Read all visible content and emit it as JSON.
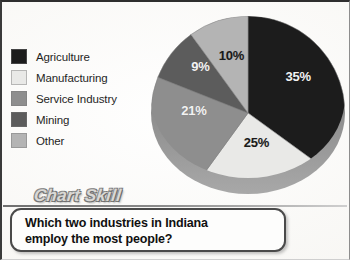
{
  "page": {
    "background_color": "#faf9f7"
  },
  "legend": {
    "name": "pie-chart-legend",
    "items": [
      {
        "label": "Agriculture",
        "color": "#1c1c1c",
        "value": 35
      },
      {
        "label": "Manufacturing",
        "color": "#e9e9e7",
        "value": 25
      },
      {
        "label": "Service Industry",
        "color": "#8e8e8e",
        "value": 21
      },
      {
        "label": "Mining",
        "color": "#5c5c5c",
        "value": 9
      },
      {
        "label": "Other",
        "color": "#b4b4b4",
        "value": 10
      }
    ]
  },
  "labels": {
    "pct_35": "35%",
    "pct_25": "25%",
    "pct_21": "21%",
    "pct_9": "9%",
    "pct_10": "10%"
  },
  "banner": {
    "title": "Chart Skill"
  },
  "question": {
    "line1": "Which two industries in Indiana",
    "line2": "employ the most people?"
  },
  "chart_data": {
    "type": "pie",
    "title": "",
    "subtitle": "",
    "categories": [
      "Agriculture",
      "Manufacturing",
      "Service Industry",
      "Mining",
      "Other"
    ],
    "values": [
      35,
      25,
      21,
      9,
      10
    ],
    "unit": "%",
    "data_labels": [
      "35%",
      "25%",
      "21%",
      "9%",
      "10%"
    ],
    "colors": [
      "#1c1c1c",
      "#e9e9e7",
      "#8e8e8e",
      "#5c5c5c",
      "#b4b4b4"
    ],
    "label_colors": [
      "#f2f2f2",
      "#1a1a1a",
      "#f2f2f2",
      "#f2f2f2",
      "#1a1a1a"
    ],
    "start_angle_deg": 0,
    "direction": "clockwise",
    "legend_position": "left",
    "style": "3d-pie",
    "grid": false,
    "xlabel": "",
    "ylabel": ""
  }
}
